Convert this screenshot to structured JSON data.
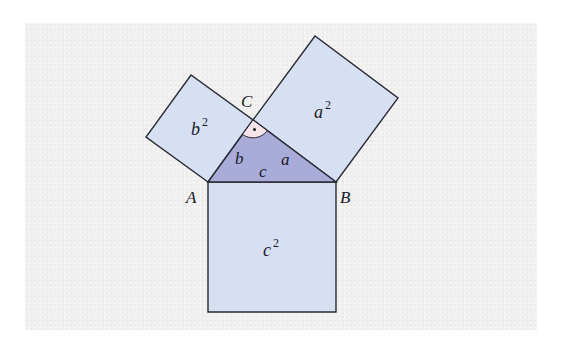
{
  "figure": {
    "vertices": {
      "A": {
        "label": "A",
        "x": 208,
        "y": 182
      },
      "B": {
        "label": "B",
        "x": 336,
        "y": 182
      },
      "C": {
        "label": "C",
        "x": 253,
        "y": 120
      }
    },
    "sides": {
      "a": {
        "label": "a"
      },
      "b": {
        "label": "b"
      },
      "c": {
        "label": "c"
      }
    },
    "squares": {
      "a2": {
        "base": "a",
        "exp": "2"
      },
      "b2": {
        "base": "b",
        "exp": "2"
      },
      "c2": {
        "base": "c",
        "exp": "2"
      }
    },
    "right_angle_marker": "·",
    "colors": {
      "square_fill": "#d7e0f3",
      "triangle_fill": "#a9acd9",
      "right_angle_fill": "#f7e4ea",
      "stroke": "#2a2a35",
      "background": "#f1f1f1"
    }
  }
}
